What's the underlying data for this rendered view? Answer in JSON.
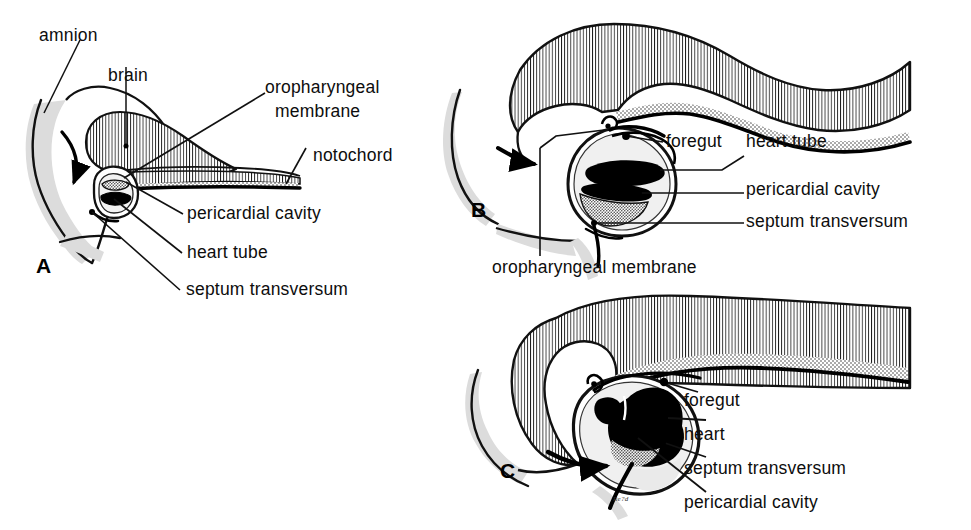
{
  "figure": {
    "background_color": "#ffffff",
    "ink_color": "#000000",
    "shadow_color": "#d6d6d6",
    "stipple_color": "#8a8a8a",
    "panels": [
      {
        "id": "A",
        "letter": "A",
        "labels": [
          {
            "key": "amnion",
            "text": "amnion"
          },
          {
            "key": "brain",
            "text": "brain"
          },
          {
            "key": "oropharyngeal_membrane_1",
            "text": "oropharyngeal"
          },
          {
            "key": "oropharyngeal_membrane_2",
            "text": "membrane"
          },
          {
            "key": "notochord",
            "text": "notochord"
          },
          {
            "key": "pericardial_cavity",
            "text": "pericardial cavity"
          },
          {
            "key": "heart_tube",
            "text": "heart tube"
          },
          {
            "key": "septum_transversum",
            "text": "septum transversum"
          }
        ]
      },
      {
        "id": "B",
        "letter": "B",
        "labels": [
          {
            "key": "foregut",
            "text": "foregut"
          },
          {
            "key": "heart_tube",
            "text": "heart tube"
          },
          {
            "key": "pericardial_cavity",
            "text": "pericardial cavity"
          },
          {
            "key": "septum_transversum",
            "text": "septum transversum"
          },
          {
            "key": "oropharyngeal_membrane",
            "text": "oropharyngeal membrane"
          }
        ]
      },
      {
        "id": "C",
        "letter": "C",
        "labels": [
          {
            "key": "foregut",
            "text": "foregut"
          },
          {
            "key": "heart",
            "text": "heart"
          },
          {
            "key": "septum_transversum",
            "text": "septum transversum"
          },
          {
            "key": "pericardial_cavity",
            "text": "pericardial cavity"
          }
        ],
        "signature": "Re?d"
      }
    ]
  },
  "labels": {
    "a_amnion": "amnion",
    "a_brain": "brain",
    "a_oro_line1": "oropharyngeal",
    "a_oro_line2": "membrane",
    "a_notochord": "notochord",
    "a_pericardial": "pericardial cavity",
    "a_heart_tube": "heart tube",
    "a_septum": "septum transversum",
    "a_letter": "A",
    "b_foregut": "foregut",
    "b_heart_tube": "heart tube",
    "b_pericardial": "pericardial cavity",
    "b_septum": "septum transversum",
    "b_oro": "oropharyngeal membrane",
    "b_letter": "B",
    "c_foregut": "foregut",
    "c_heart": "heart",
    "c_septum": "septum transversum",
    "c_pericardial": "pericardial cavity",
    "c_letter": "C",
    "c_signature": "Re?d"
  }
}
